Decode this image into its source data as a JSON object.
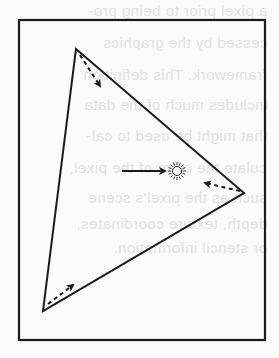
{
  "figure": {
    "frame": {
      "x": 19,
      "y": 20,
      "width": 246,
      "height": 320
    },
    "triangle": {
      "vertices": [
        [
          76,
          49
        ],
        [
          244,
          193
        ],
        [
          43,
          311
        ]
      ]
    },
    "dashed_arrows": [
      {
        "from": [
          80,
          55
        ],
        "to": [
          101,
          88
        ]
      },
      {
        "from": [
          241,
          191
        ],
        "to": [
          203,
          183
        ]
      },
      {
        "from": [
          48,
          304
        ],
        "to": [
          74,
          284
        ]
      }
    ],
    "solid_arrow": {
      "from": [
        122,
        171
      ],
      "to": [
        167,
        171
      ]
    },
    "light_source": {
      "icon": "sun-icon",
      "cx": 177,
      "cy": 171,
      "r": 5
    },
    "colors": {
      "stroke": "#1a1a1a",
      "background": "#fbfbfa",
      "bleed_text": "#e2e2e0"
    }
  },
  "bleed_through_text": {
    "lines": [
      "a pixel prior to being pro-",
      "cessed by the graphics",
      "framework. This definition",
      "includes much of the data",
      "that might be used to cal-",
      "culate the color of the pixel,",
      "such as the pixel's scene",
      "depth, texture coordinates,",
      "or stencil information."
    ],
    "tops": [
      2,
      34,
      66,
      96,
      127,
      159,
      189,
      215,
      239
    ]
  }
}
